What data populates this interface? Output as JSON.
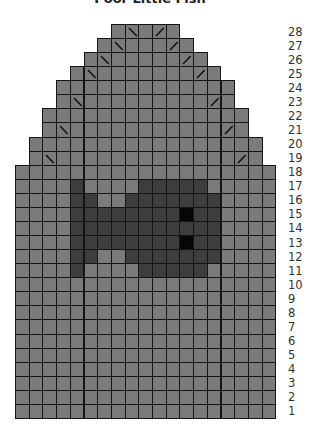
{
  "title": "Poor Little Fish",
  "grid": {
    "columns": 19,
    "rows": 28,
    "origin_x": 15,
    "origin_y": 24,
    "cell_w": 13.7,
    "cell_h": 14.07
  },
  "colors": {
    "main": "#7b7b7b",
    "contrast": "#3d3d3d",
    "eye": "#060606",
    "gridline": "#151515",
    "mark": "#111111"
  },
  "row_extents": [
    {
      "row": 28,
      "from": 7,
      "to": 11
    },
    {
      "row": 27,
      "from": 6,
      "to": 12
    },
    {
      "row": 26,
      "from": 5,
      "to": 13
    },
    {
      "row": 25,
      "from": 4,
      "to": 14
    },
    {
      "row": 24,
      "from": 3,
      "to": 15
    },
    {
      "row": 23,
      "from": 3,
      "to": 15
    },
    {
      "row": 22,
      "from": 2,
      "to": 16
    },
    {
      "row": 21,
      "from": 2,
      "to": 16
    },
    {
      "row": 20,
      "from": 1,
      "to": 17
    },
    {
      "row": 19,
      "from": 1,
      "to": 17
    },
    {
      "row": 18,
      "from": 0,
      "to": 18
    },
    {
      "row": 17,
      "from": 0,
      "to": 18
    },
    {
      "row": 16,
      "from": 0,
      "to": 18
    },
    {
      "row": 15,
      "from": 0,
      "to": 18
    },
    {
      "row": 14,
      "from": 0,
      "to": 18
    },
    {
      "row": 13,
      "from": 0,
      "to": 18
    },
    {
      "row": 12,
      "from": 0,
      "to": 18
    },
    {
      "row": 11,
      "from": 0,
      "to": 18
    },
    {
      "row": 10,
      "from": 0,
      "to": 18
    },
    {
      "row": 9,
      "from": 0,
      "to": 18
    },
    {
      "row": 8,
      "from": 0,
      "to": 18
    },
    {
      "row": 7,
      "from": 0,
      "to": 18
    },
    {
      "row": 6,
      "from": 0,
      "to": 18
    },
    {
      "row": 5,
      "from": 0,
      "to": 18
    },
    {
      "row": 4,
      "from": 0,
      "to": 18
    },
    {
      "row": 3,
      "from": 0,
      "to": 18
    },
    {
      "row": 2,
      "from": 0,
      "to": 18
    },
    {
      "row": 1,
      "from": 0,
      "to": 18
    }
  ],
  "decrease_marks": [
    {
      "row": 28,
      "col": 8,
      "type": "ssk"
    },
    {
      "row": 28,
      "col": 10,
      "type": "k2tog"
    },
    {
      "row": 27,
      "col": 7,
      "type": "ssk"
    },
    {
      "row": 27,
      "col": 11,
      "type": "k2tog"
    },
    {
      "row": 26,
      "col": 6,
      "type": "ssk"
    },
    {
      "row": 26,
      "col": 12,
      "type": "k2tog"
    },
    {
      "row": 25,
      "col": 5,
      "type": "ssk"
    },
    {
      "row": 25,
      "col": 13,
      "type": "k2tog"
    },
    {
      "row": 23,
      "col": 4,
      "type": "ssk"
    },
    {
      "row": 23,
      "col": 14,
      "type": "k2tog"
    },
    {
      "row": 21,
      "col": 3,
      "type": "ssk"
    },
    {
      "row": 21,
      "col": 15,
      "type": "k2tog"
    },
    {
      "row": 19,
      "col": 2,
      "type": "ssk"
    },
    {
      "row": 19,
      "col": 16,
      "type": "k2tog"
    }
  ],
  "motif": {
    "name": "fish",
    "contrast_cells": {
      "17": [
        4,
        9,
        10,
        11,
        12,
        13
      ],
      "16": [
        4,
        5,
        8,
        9,
        10,
        11,
        12,
        13,
        14
      ],
      "15": [
        4,
        5,
        6,
        7,
        8,
        9,
        10,
        11,
        13,
        14
      ],
      "14": [
        4,
        5,
        6,
        7,
        8,
        9,
        10,
        11,
        12,
        13,
        14
      ],
      "13": [
        4,
        5,
        6,
        7,
        8,
        9,
        10,
        11,
        13,
        14
      ],
      "12": [
        4,
        5,
        8,
        9,
        10,
        11,
        12,
        13,
        14
      ],
      "11": [
        4,
        9,
        10,
        11,
        12,
        13
      ]
    },
    "eye_cells": {
      "15": [
        12
      ],
      "13": [
        12
      ]
    }
  },
  "row_labels": [
    "28",
    "27",
    "26",
    "25",
    "24",
    "23",
    "22",
    "21",
    "20",
    "19",
    "18",
    "17",
    "16",
    "15",
    "14",
    "13",
    "12",
    "11",
    "10",
    "9",
    "8",
    "7",
    "6",
    "5",
    "4",
    "3",
    "2",
    "1"
  ]
}
